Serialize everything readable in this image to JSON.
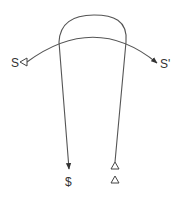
{
  "diagram": {
    "labels": {
      "left": "S",
      "right": "S'",
      "bottom_left": "$",
      "bottom_right_symbol": "triangle-open"
    },
    "colors": {
      "stroke": "#555555",
      "text": "#333333",
      "background": "#ffffff"
    },
    "elements": [
      {
        "type": "arc-arrow",
        "from": "S",
        "to": "S'",
        "start_marker": "open-triangle",
        "end_marker": "filled-arrow"
      },
      {
        "type": "arch-arrow",
        "from": "triangle-open",
        "to": "$",
        "start_marker": "open-triangle",
        "end_marker": "filled-arrow"
      }
    ]
  }
}
